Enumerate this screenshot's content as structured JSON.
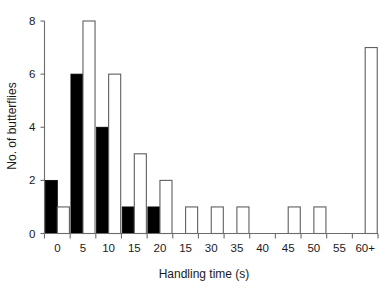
{
  "chart_data": {
    "type": "bar",
    "title": "",
    "subtitle": "",
    "xlabel": "Handling time (s)",
    "ylabel": "No. of butterflies",
    "categories": [
      "0",
      "5",
      "10",
      "15",
      "20",
      "15",
      "30",
      "35",
      "40",
      "45",
      "50",
      "55",
      "60+"
    ],
    "x_tick_labels": [
      "0",
      "5",
      "10",
      "15",
      "20",
      "15",
      "30",
      "35",
      "40",
      "45",
      "50",
      "55",
      "60+"
    ],
    "y_tick_labels": [
      "0",
      "2",
      "4",
      "6",
      "8"
    ],
    "y_ticks": [
      0,
      2,
      4,
      6,
      8
    ],
    "ylim": [
      0,
      8
    ],
    "grid": false,
    "legend": "none",
    "legend_position": "none",
    "series": [
      {
        "name": "filled",
        "style": "filled-black",
        "color": "#000000",
        "values": [
          2,
          6,
          4,
          1,
          1,
          0,
          0,
          0,
          0,
          0,
          0,
          0,
          0
        ]
      },
      {
        "name": "open",
        "style": "open-white",
        "color": "#ffffff",
        "edge_color": "#5f5f5f",
        "values": [
          1,
          8,
          6,
          3,
          2,
          1,
          1,
          1,
          0,
          1,
          1,
          0,
          7
        ]
      }
    ],
    "bars": [
      {
        "category": "0",
        "filled": 2,
        "open": 1
      },
      {
        "category": "5",
        "filled": 6,
        "open": 8
      },
      {
        "category": "10",
        "filled": 4,
        "open": 6
      },
      {
        "category": "15",
        "filled": 1,
        "open": 3
      },
      {
        "category": "20",
        "filled": 1,
        "open": 2
      },
      {
        "category": "15",
        "filled": 0,
        "open": 1
      },
      {
        "category": "30",
        "filled": 0,
        "open": 1
      },
      {
        "category": "35",
        "filled": 0,
        "open": 1
      },
      {
        "category": "40",
        "filled": 0,
        "open": 0
      },
      {
        "category": "45",
        "filled": 0,
        "open": 1
      },
      {
        "category": "50",
        "filled": 0,
        "open": 1
      },
      {
        "category": "55",
        "filled": 0,
        "open": 0
      },
      {
        "category": "60+",
        "filled": 0,
        "open": 7
      }
    ]
  },
  "colors": {
    "background": "#ffffff",
    "axis": "#6b6b6b",
    "text": "#1a1a1a",
    "filled_bar": "#000000",
    "open_bar_fill": "#ffffff",
    "open_bar_edge": "#5f5f5f"
  }
}
